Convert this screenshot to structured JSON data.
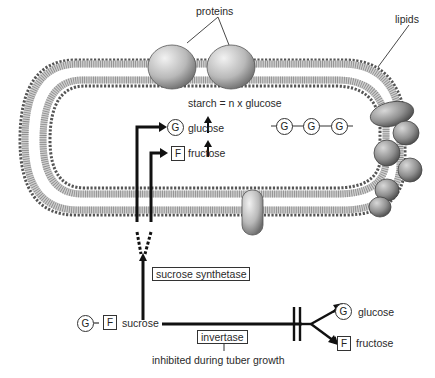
{
  "labels": {
    "proteins": "proteins",
    "lipids": "lipids",
    "starch_eq": "starch = n x glucose",
    "glucose_in": "glucose",
    "fructose_in": "fructose",
    "sucrose_synthetase": "sucrose synthetase",
    "sucrose": "sucrose",
    "invertase": "invertase",
    "inhibited": "inhibited during tuber growth",
    "glucose_out": "glucose",
    "fructose_out": "fructose"
  },
  "symbols": {
    "glucose": "G",
    "fructose": "F",
    "bond": "-"
  },
  "colors": {
    "ink": "#222222",
    "membrane": "#555555",
    "protein_fill": "#bdbdbd"
  }
}
